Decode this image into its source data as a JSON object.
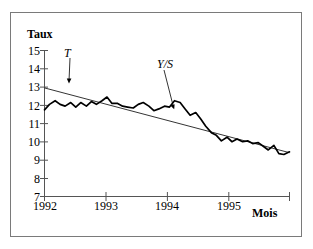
{
  "figure": {
    "border_color": "#7a7a7a",
    "background": "#ffffff"
  },
  "axes": {
    "y_title": "Taux",
    "x_title": "Mois",
    "y_ticks": [
      15,
      14,
      13,
      12,
      11,
      10,
      9,
      8,
      7
    ],
    "x_ticks": [
      "1992",
      "1993",
      "1994",
      "1995"
    ]
  },
  "annotations": {
    "trend_label": "T",
    "series_label": "Y/S"
  },
  "chart_data": {
    "type": "line",
    "title": "",
    "subtitle": "",
    "xlabel": "Mois",
    "ylabel": "Taux",
    "ylim": [
      7,
      15
    ],
    "xlim": [
      1992.0,
      1995.92
    ],
    "grid": false,
    "legend_position": "none",
    "annotations": [
      {
        "text": "T",
        "points_to": "trend-line",
        "x": 1992.35,
        "y": 12.65
      },
      {
        "text": "Y/S",
        "points_to": "observed-series",
        "x": 1994.1,
        "y": 12.3
      }
    ],
    "series": [
      {
        "name": "Y/S",
        "style": "thick-black-line",
        "color": "#000000",
        "x": [
          1992.0,
          1992.08,
          1992.17,
          1992.25,
          1992.33,
          1992.42,
          1992.5,
          1992.58,
          1992.67,
          1992.75,
          1992.83,
          1992.92,
          1993.0,
          1993.08,
          1993.17,
          1993.25,
          1993.33,
          1993.42,
          1993.5,
          1993.58,
          1993.67,
          1993.75,
          1993.83,
          1993.92,
          1994.0,
          1994.08,
          1994.17,
          1994.25,
          1994.33,
          1994.42,
          1994.5,
          1994.58,
          1994.67,
          1994.75,
          1994.83,
          1994.92,
          1995.0,
          1995.08,
          1995.17,
          1995.25,
          1995.33,
          1995.42,
          1995.5,
          1995.58,
          1995.67,
          1995.75,
          1995.83,
          1995.92
        ],
        "values": [
          11.75,
          12.05,
          12.25,
          12.05,
          11.95,
          12.15,
          11.9,
          12.15,
          11.95,
          12.2,
          12.05,
          12.25,
          12.45,
          12.1,
          12.1,
          11.95,
          11.9,
          11.85,
          12.05,
          12.15,
          11.95,
          11.7,
          11.8,
          11.95,
          11.9,
          12.25,
          12.15,
          11.8,
          11.45,
          11.6,
          11.25,
          10.85,
          10.5,
          10.35,
          10.05,
          10.25,
          10.0,
          10.15,
          10.0,
          10.05,
          9.9,
          9.95,
          9.75,
          9.55,
          9.8,
          9.35,
          9.3,
          9.45
        ]
      },
      {
        "name": "T",
        "style": "thin-straight-trend-line",
        "color": "#000000",
        "x": [
          1992.0,
          1995.92
        ],
        "values": [
          12.95,
          9.4
        ]
      }
    ]
  }
}
